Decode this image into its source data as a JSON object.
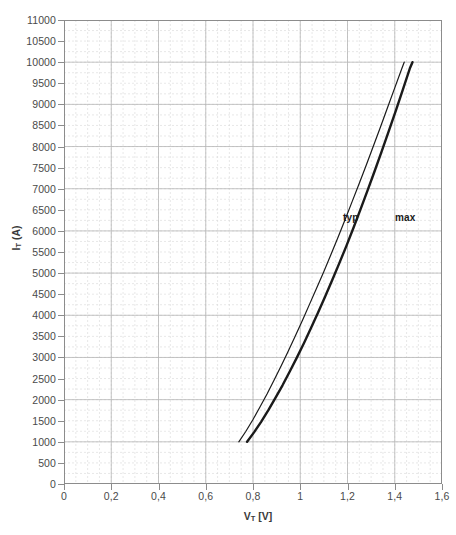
{
  "chart_data": {
    "type": "line",
    "title": "",
    "xlabel": "VT [V]",
    "xlabel_base": "V",
    "xlabel_sub": "T",
    "xlabel_unit": " [V]",
    "ylabel": "IT (A)",
    "ylabel_base": "I",
    "ylabel_sub": "T",
    "ylabel_unit": " (A)",
    "xlim": [
      0,
      1.6
    ],
    "ylim": [
      0,
      11000
    ],
    "xtick_step": 0.2,
    "ytick_step": 500,
    "x_minor_step": 0.05,
    "y_minor_step": 250,
    "grid": true,
    "grid_major_color": "#b5b5b5",
    "grid_minor_color": "#d8d8d8",
    "legend": "inline-annotation",
    "decimal_separator": ",",
    "xticks": [
      "0",
      "0,2",
      "0,4",
      "0,6",
      "0,8",
      "1",
      "1,2",
      "1,4",
      "1,6"
    ],
    "xtick_values": [
      0,
      0.2,
      0.4,
      0.6,
      0.8,
      1.0,
      1.2,
      1.4,
      1.6
    ],
    "yticks": [
      "0",
      "500",
      "1000",
      "1500",
      "2000",
      "2500",
      "3000",
      "3500",
      "4000",
      "4500",
      "5000",
      "5500",
      "6000",
      "6500",
      "7000",
      "7500",
      "8000",
      "8500",
      "9000",
      "9500",
      "10000",
      "10500",
      "11000"
    ],
    "ytick_values": [
      0,
      500,
      1000,
      1500,
      2000,
      2500,
      3000,
      3500,
      4000,
      4500,
      5000,
      5500,
      6000,
      6500,
      7000,
      7500,
      8000,
      8500,
      9000,
      9500,
      10000,
      10500,
      11000
    ],
    "annotations": [
      {
        "text": "typ",
        "x": 1.25,
        "y": 6400,
        "px": 343,
        "py": 212
      },
      {
        "text": "max",
        "x": 1.41,
        "y": 6400,
        "px": 395,
        "py": 212
      }
    ],
    "series": [
      {
        "name": "typ",
        "label": "typ",
        "color": "#1a1a1a",
        "width": 1.2,
        "points": [
          [
            0.74,
            1000
          ],
          [
            0.77,
            1250
          ],
          [
            0.8,
            1530
          ],
          [
            0.83,
            1830
          ],
          [
            0.86,
            2140
          ],
          [
            0.89,
            2470
          ],
          [
            0.92,
            2810
          ],
          [
            0.95,
            3160
          ],
          [
            0.98,
            3520
          ],
          [
            1.01,
            3890
          ],
          [
            1.04,
            4270
          ],
          [
            1.07,
            4650
          ],
          [
            1.1,
            5040
          ],
          [
            1.13,
            5440
          ],
          [
            1.16,
            5850
          ],
          [
            1.19,
            6270
          ],
          [
            1.22,
            6700
          ],
          [
            1.25,
            7130
          ],
          [
            1.28,
            7570
          ],
          [
            1.31,
            8020
          ],
          [
            1.34,
            8470
          ],
          [
            1.37,
            8930
          ],
          [
            1.4,
            9390
          ],
          [
            1.43,
            9850
          ],
          [
            1.44,
            10000
          ]
        ]
      },
      {
        "name": "max",
        "label": "max",
        "color": "#1a1a1a",
        "width": 2.4,
        "points": [
          [
            0.775,
            1000
          ],
          [
            0.805,
            1230
          ],
          [
            0.835,
            1480
          ],
          [
            0.865,
            1750
          ],
          [
            0.895,
            2040
          ],
          [
            0.925,
            2340
          ],
          [
            0.955,
            2660
          ],
          [
            0.985,
            2990
          ],
          [
            1.015,
            3330
          ],
          [
            1.045,
            3690
          ],
          [
            1.075,
            4060
          ],
          [
            1.105,
            4440
          ],
          [
            1.135,
            4830
          ],
          [
            1.165,
            5230
          ],
          [
            1.195,
            5640
          ],
          [
            1.225,
            6070
          ],
          [
            1.255,
            6510
          ],
          [
            1.285,
            6960
          ],
          [
            1.315,
            7420
          ],
          [
            1.345,
            7890
          ],
          [
            1.375,
            8370
          ],
          [
            1.405,
            8860
          ],
          [
            1.435,
            9360
          ],
          [
            1.465,
            9870
          ],
          [
            1.475,
            10000
          ]
        ]
      }
    ]
  }
}
